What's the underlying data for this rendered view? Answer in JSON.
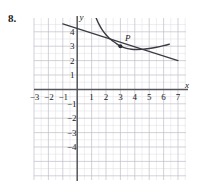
{
  "problem": {
    "number": "8."
  },
  "figure": {
    "axis_labels": {
      "x": "x",
      "y": "y"
    },
    "point_labels": [
      {
        "name": "P",
        "x": 3,
        "y": 3
      }
    ],
    "x_ticks": [
      "-3",
      "-2",
      "-1",
      "1",
      "2",
      "3",
      "4",
      "5",
      "6",
      "7"
    ],
    "y_ticks": [
      "4",
      "3",
      "2",
      "1",
      "-1",
      "-2",
      "-3",
      "-4"
    ],
    "colors": {
      "grid_minor": "#d9d9e2",
      "grid_major": "#b9b9c4",
      "axis": "#55555c",
      "curve": "#3a3a42",
      "tangent": "#3a3a42",
      "text": "#1a1a1a"
    }
  },
  "chart_data": {
    "type": "line",
    "title": "",
    "xlabel": "x",
    "ylabel": "y",
    "xlim": [
      -3.4,
      7.4
    ],
    "ylim": [
      -4.6,
      5.0
    ],
    "grid": true,
    "legend": "none",
    "xticks": [
      -3,
      -2,
      -1,
      1,
      2,
      3,
      4,
      5,
      6,
      7
    ],
    "yticks": [
      4,
      3,
      2,
      1,
      -1,
      -2,
      -3,
      -4
    ],
    "annotations": [
      {
        "text": "P",
        "x": 3,
        "y": 3,
        "marker": true
      }
    ],
    "series": [
      {
        "name": "curve",
        "type": "curve",
        "x": [
          1.3,
          1.5,
          1.75,
          2.0,
          2.25,
          2.5,
          2.75,
          3.0,
          3.25,
          3.5,
          3.75,
          4.0,
          4.5,
          5.0,
          5.5,
          6.0,
          6.4
        ],
        "y": [
          5.0,
          4.55,
          4.12,
          3.8,
          3.54,
          3.34,
          3.16,
          3.0,
          2.9,
          2.83,
          2.79,
          2.77,
          2.78,
          2.84,
          2.93,
          3.04,
          3.14
        ]
      },
      {
        "name": "tangent",
        "type": "line",
        "x": [
          -1.0,
          0.0,
          3.0,
          7.0
        ],
        "y": [
          4.55,
          4.33,
          3.0,
          2.0
        ]
      }
    ]
  }
}
